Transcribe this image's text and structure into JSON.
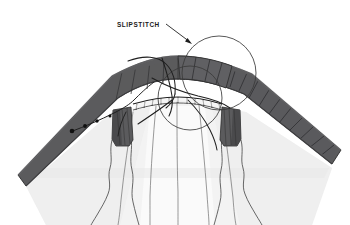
{
  "figure": {
    "kind": "sewing-instruction-illustration",
    "background_color": "#ffffff",
    "callout": {
      "label": "SLIPSTITCH",
      "label_x": 117,
      "label_y": 26,
      "leader_line": {
        "from_x": 166,
        "from_y": 24,
        "to_x": 192,
        "to_y": 44,
        "arrowhead": "filled-triangle"
      }
    },
    "colors": {
      "band_fabric": "#5b5b5d",
      "band_fabric_dark": "#4a4a4c",
      "band_fabric_light": "#6e6e70",
      "skirt_fabric": "#f2f2f2",
      "skirt_shadow": "#e4e4e4",
      "outline": "#2b2b2b",
      "thread": "#1f1f1f",
      "stitch_dot": "#111111",
      "label_text": "#1a1a1a"
    },
    "elements": [
      {
        "name": "hem-band",
        "description": "Dark gray curved waistband arcing across the upper half"
      },
      {
        "name": "band-rib-hatching",
        "description": "Vertical rib lines across right portion of band"
      },
      {
        "name": "skirt-body",
        "description": "Light gray draped fabric below the band"
      },
      {
        "name": "skirt-fold-lines",
        "description": "Five vertical drape lines in the skirt"
      },
      {
        "name": "center-seam",
        "description": "Horizontal stitched seam with tick marks at center"
      },
      {
        "name": "thread-loop-large",
        "description": "Large thin circle showing working thread loop"
      },
      {
        "name": "thread-loop-small",
        "description": "Second smaller thread loop circle, lower left of the large one"
      },
      {
        "name": "running-thread",
        "description": "Diagonal thread line on the left band with stitch dots"
      },
      {
        "name": "stitch-dots",
        "description": "Four dark entry dots along the running thread"
      },
      {
        "name": "left-facing-tab",
        "description": "Dark vertical facing tab at center-left"
      },
      {
        "name": "right-facing-tab",
        "description": "Dark vertical facing tab at center-right"
      }
    ],
    "stitch_dots": [
      {
        "x": 72,
        "y": 131
      },
      {
        "x": 85,
        "y": 126
      },
      {
        "x": 97,
        "y": 121
      },
      {
        "x": 110,
        "y": 116
      }
    ],
    "thread_loops": [
      {
        "name": "thread-loop-large",
        "cx": 219,
        "cy": 73,
        "r": 37
      },
      {
        "name": "thread-loop-small",
        "cx": 190,
        "cy": 98,
        "r": 32
      }
    ]
  }
}
